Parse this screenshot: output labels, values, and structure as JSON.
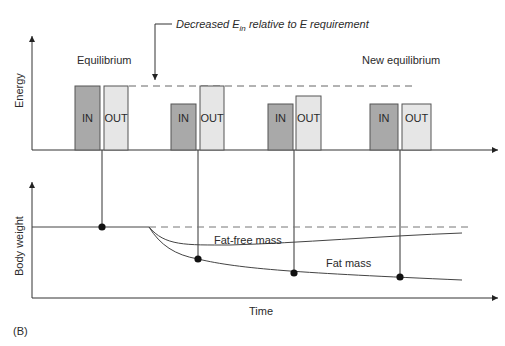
{
  "annotation": {
    "prefix": "Decreased E",
    "subscript": "in",
    "suffix": " relative to E requirement"
  },
  "top_panel": {
    "y_axis_label": "Energy",
    "equilibrium_label": "Equilibrium",
    "new_equilibrium_label": "New equilibrium",
    "bars": [
      {
        "label": "IN",
        "type": "in"
      },
      {
        "label": "OUT",
        "type": "out"
      },
      {
        "label": "IN",
        "type": "in"
      },
      {
        "label": "OUT",
        "type": "out"
      },
      {
        "label": "IN",
        "type": "in"
      },
      {
        "label": "OUT",
        "type": "out"
      },
      {
        "label": "IN",
        "type": "in"
      },
      {
        "label": "OUT",
        "type": "out"
      }
    ]
  },
  "bottom_panel": {
    "y_axis_label": "Body weight",
    "x_axis_label": "Time",
    "fat_free_mass_label": "Fat-free mass",
    "fat_mass_label": "Fat mass"
  },
  "panel_tag": "(B)",
  "colors": {
    "in_bar": "#a9a9a9",
    "out_bar": "#e6e6e6",
    "stroke": "#333333"
  }
}
